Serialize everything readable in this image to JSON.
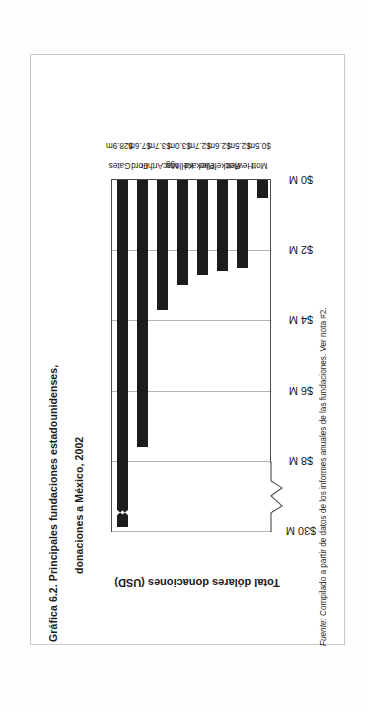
{
  "figure": {
    "title_line1": "Gráfica 6.2.   Principales fundaciones estadounidenses,",
    "title_line2": "donaciones a México, 2002",
    "source_label": "Fuente:",
    "source_text": " Compilado a partir de datos de los informes anuales de las fundaciones. Ver nota #2."
  },
  "chart_data": {
    "type": "bar",
    "orientation": "vertical-rotated",
    "title": "Gráfica 6.2. Principales fundaciones estadounidenses, donaciones a México, 2002",
    "xlabel": "",
    "ylabel": "Total dólares donaciones (USD)",
    "categories": [
      "Mott",
      "Hewlett",
      "Rockefeller",
      "Packard",
      "Kellogg",
      "MacArthur",
      "Ford",
      "Gates"
    ],
    "values": [
      0.5,
      2.5,
      2.6,
      2.7,
      3.0,
      3.7,
      7.6,
      28.9
    ],
    "value_labels": [
      "$0.5m",
      "$2.5m",
      "$2.6m",
      "$2.7m",
      "$3.0m",
      "$3.7m",
      "$7.6m",
      "$28.9m"
    ],
    "unit": "millions USD",
    "ylim": [
      0,
      30
    ],
    "axis_break": {
      "present": true,
      "between": [
        8,
        30
      ],
      "note": "scale broken between $8 M and $30 M"
    },
    "tick_labels": [
      "$0 M",
      "$2 M",
      "$4 M",
      "$6 M",
      "$8 M",
      "$30 M"
    ],
    "tick_values": [
      0,
      2,
      4,
      6,
      8,
      30
    ],
    "grid": true,
    "legend": "none",
    "bar_color": "#1c1c1c",
    "grid_color": "#b4b4b4",
    "source": "Fuente: Compilado a partir de datos de los informes anuales de las fundaciones. Ver nota #2."
  }
}
